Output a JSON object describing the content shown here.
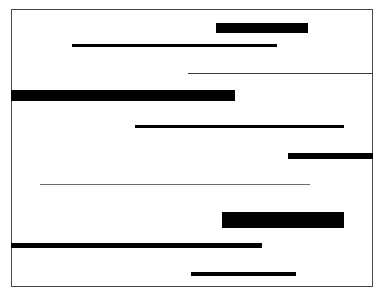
{
  "figure": {
    "canvas": {
      "width": 384,
      "height": 296,
      "background": "#ffffff"
    },
    "frame": {
      "label": "page-border",
      "x": 11,
      "y": 9,
      "width": 362,
      "height": 278,
      "border_width": 1,
      "border_color": "#4a4a4a"
    },
    "bar_color": "#000000",
    "hairline_color": "#3a3a3a",
    "light_hairline_color": "#6e6e6e",
    "bars": [
      {
        "id": 1,
        "label": "bar-1-thick-right",
        "x": 216,
        "y": 23,
        "width": 92,
        "height": 10,
        "weight": "thick",
        "color": "#000000"
      },
      {
        "id": 2,
        "label": "bar-2-medium-center",
        "x": 72,
        "y": 44,
        "width": 205,
        "height": 3,
        "weight": "medium",
        "color": "#000000"
      },
      {
        "id": 3,
        "label": "bar-3-hairline-to-edge",
        "x": 188,
        "y": 73,
        "width": 185,
        "height": 1,
        "weight": "hairline",
        "color": "#3a3a3a"
      },
      {
        "id": 4,
        "label": "bar-4-thick-from-left",
        "x": 11,
        "y": 90,
        "width": 224,
        "height": 11,
        "weight": "thick",
        "color": "#000000"
      },
      {
        "id": 5,
        "label": "bar-5-medium-long",
        "x": 135,
        "y": 125,
        "width": 209,
        "height": 3,
        "weight": "medium",
        "color": "#000000"
      },
      {
        "id": 6,
        "label": "bar-6-thick-to-edge",
        "x": 288,
        "y": 153,
        "width": 85,
        "height": 6,
        "weight": "thick",
        "color": "#000000"
      },
      {
        "id": 7,
        "label": "bar-7-light-hairline",
        "x": 40,
        "y": 184,
        "width": 270,
        "height": 1,
        "weight": "light-hairline",
        "color": "#6e6e6e"
      },
      {
        "id": 8,
        "label": "bar-8-thick-block",
        "x": 222,
        "y": 212,
        "width": 122,
        "height": 16,
        "weight": "thick",
        "color": "#000000"
      },
      {
        "id": 9,
        "label": "bar-9-heavy-from-left",
        "x": 11,
        "y": 243,
        "width": 251,
        "height": 5,
        "weight": "heavy",
        "color": "#000000"
      },
      {
        "id": 10,
        "label": "bar-10-medium-bottom",
        "x": 191,
        "y": 272,
        "width": 105,
        "height": 4,
        "weight": "medium",
        "color": "#000000"
      }
    ]
  },
  "chart_data": {
    "type": "bar",
    "orientation": "horizontal",
    "xlabel": "",
    "ylabel": "",
    "xlim": [
      11,
      373
    ],
    "ylim": [
      9,
      287
    ],
    "grid": false,
    "legend": null,
    "categories": [
      "bar-1",
      "bar-2",
      "bar-3",
      "bar-4",
      "bar-5",
      "bar-6",
      "bar-7",
      "bar-8",
      "bar-9",
      "bar-10"
    ],
    "series": [
      {
        "name": "bar start x (px)",
        "values": [
          216,
          72,
          188,
          11,
          135,
          288,
          40,
          222,
          11,
          191
        ]
      },
      {
        "name": "bar length (px)",
        "values": [
          92,
          205,
          185,
          224,
          209,
          85,
          270,
          122,
          251,
          105
        ]
      },
      {
        "name": "bar thickness (px)",
        "values": [
          10,
          3,
          1,
          11,
          3,
          6,
          1,
          16,
          5,
          4
        ]
      },
      {
        "name": "bar top y (px)",
        "values": [
          23,
          44,
          73,
          90,
          125,
          153,
          184,
          212,
          243,
          272
        ]
      }
    ],
    "annotations": [
      "Bars 4 and 9 touch the left frame edge",
      "Bars 3 and 6 touch the right frame edge",
      "Bar 8 is the heaviest block; bar 7 is the faintest rule"
    ]
  }
}
